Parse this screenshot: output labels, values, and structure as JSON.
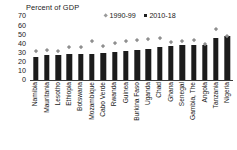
{
  "chart_data": {
    "type": "bar",
    "title": "Percent of GDP",
    "xlabel": "",
    "ylabel": "",
    "ylim": [
      0,
      70
    ],
    "yticks": [
      70,
      60,
      50,
      40,
      30,
      20,
      10,
      0
    ],
    "grid": false,
    "legend_position": "top-center",
    "categories": [
      "Namibia",
      "Mauritania",
      "Lesotho",
      "Ethiopia",
      "Botswana",
      "Mozambique",
      "Cabo Verde",
      "Rwanda",
      "Guinea",
      "Burkina Faso",
      "Uganda",
      "Chad",
      "Ghana",
      "Senegal",
      "Gambia, The",
      "Angola",
      "Tanzania",
      "Nigeria"
    ],
    "series": [
      {
        "name": "2010-18",
        "type": "bar",
        "color": "#1c1c1c",
        "values": [
          25,
          27,
          27,
          28,
          28,
          29,
          30,
          31,
          32,
          33,
          34,
          36,
          37,
          38,
          38,
          38,
          46,
          48
        ]
      },
      {
        "name": "1990-99",
        "type": "scatter",
        "marker": "diamond",
        "color": "#8f8f8f",
        "values": [
          31,
          33,
          32,
          36,
          36,
          43,
          37,
          40,
          42,
          44,
          45,
          46,
          41,
          43,
          44,
          39,
          56,
          48
        ]
      }
    ]
  },
  "legend": {
    "items": [
      {
        "label": "1990-99",
        "marker": "diamond",
        "color": "#8f8f8f"
      },
      {
        "label": "2010-18",
        "marker": "square",
        "color": "#1c1c1c"
      }
    ]
  },
  "colors": {
    "bar": "#1c1c1c",
    "marker": "#8f8f8f",
    "axis": "#3c3c3c",
    "text": "#1a1a1a",
    "background": "#ffffff"
  }
}
